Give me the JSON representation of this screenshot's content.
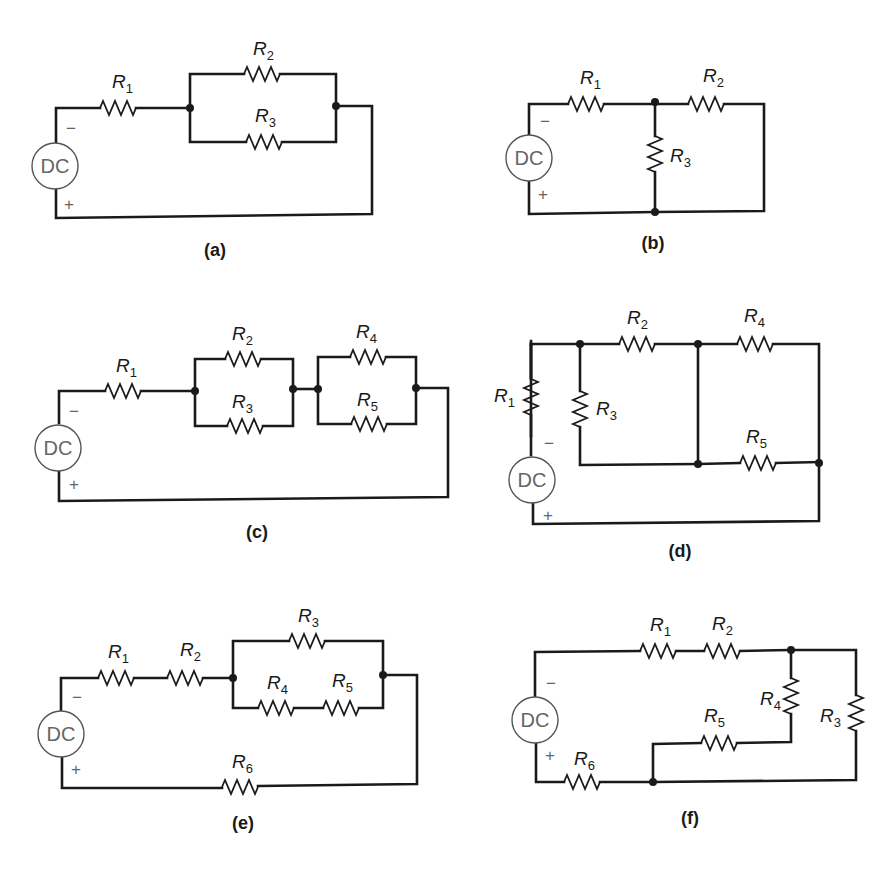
{
  "figure": {
    "source_label": "DC",
    "minus": "−",
    "plus": "+",
    "circuits": [
      {
        "caption": "(a)",
        "resistors": [
          {
            "name": "R",
            "sub": "1"
          },
          {
            "name": "R",
            "sub": "2"
          },
          {
            "name": "R",
            "sub": "3"
          }
        ],
        "topology": "R1 in series with (R2 ∥ R3)"
      },
      {
        "caption": "(b)",
        "resistors": [
          {
            "name": "R",
            "sub": "1"
          },
          {
            "name": "R",
            "sub": "2"
          },
          {
            "name": "R",
            "sub": "3"
          }
        ],
        "topology": "R1 in series with (R3 ∥ R2)"
      },
      {
        "caption": "(c)",
        "resistors": [
          {
            "name": "R",
            "sub": "1"
          },
          {
            "name": "R",
            "sub": "2"
          },
          {
            "name": "R",
            "sub": "3"
          },
          {
            "name": "R",
            "sub": "4"
          },
          {
            "name": "R",
            "sub": "5"
          }
        ],
        "topology": "R1 + (R2 ∥ R3) + (R4 ∥ R5)"
      },
      {
        "caption": "(d)",
        "resistors": [
          {
            "name": "R",
            "sub": "1"
          },
          {
            "name": "R",
            "sub": "2"
          },
          {
            "name": "R",
            "sub": "3"
          },
          {
            "name": "R",
            "sub": "4"
          },
          {
            "name": "R",
            "sub": "5"
          }
        ],
        "topology": "R1 + (R3 ∥ R2) with R4 ∥ R5 bridge"
      },
      {
        "caption": "(e)",
        "resistors": [
          {
            "name": "R",
            "sub": "1"
          },
          {
            "name": "R",
            "sub": "2"
          },
          {
            "name": "R",
            "sub": "3"
          },
          {
            "name": "R",
            "sub": "4"
          },
          {
            "name": "R",
            "sub": "5"
          },
          {
            "name": "R",
            "sub": "6"
          }
        ],
        "topology": "R1 + R2 + (R3 ∥ (R4 + R5)) + R6"
      },
      {
        "caption": "(f)",
        "resistors": [
          {
            "name": "R",
            "sub": "1"
          },
          {
            "name": "R",
            "sub": "2"
          },
          {
            "name": "R",
            "sub": "3"
          },
          {
            "name": "R",
            "sub": "4"
          },
          {
            "name": "R",
            "sub": "5"
          },
          {
            "name": "R",
            "sub": "6"
          }
        ],
        "topology": "R1 + R2 + (R3 ∥ (R4 + R5)) + R6"
      }
    ]
  }
}
